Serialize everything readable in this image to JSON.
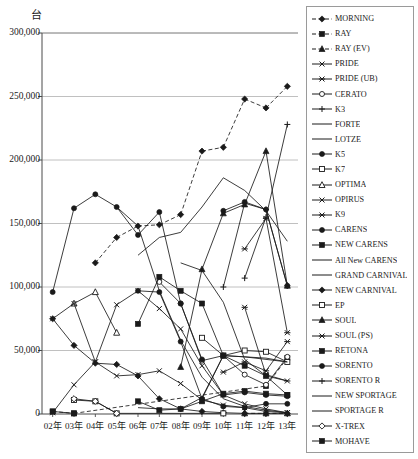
{
  "chart_data": {
    "type": "line",
    "title": "",
    "unit_label": "台",
    "xlabel": "",
    "ylabel": "",
    "ylim": [
      0,
      300000
    ],
    "ytick_values": [
      0,
      50000,
      100000,
      150000,
      200000,
      250000,
      300000
    ],
    "ytick_labels": [
      "0",
      "50,000",
      "100,000",
      "150,000",
      "200,000",
      "250,000",
      "300,000"
    ],
    "grid": true,
    "grid_color": "#b0b0b0",
    "legend_position": "right",
    "categories": [
      "02年",
      "03年",
      "04年",
      "05年",
      "06年",
      "07年",
      "08年",
      "09年",
      "10年",
      "11年",
      "12年",
      "13年"
    ],
    "series": [
      {
        "name": "MORNING",
        "marker": "diamond-filled",
        "line": "dashed",
        "values": [
          null,
          null,
          119000,
          139000,
          148000,
          149000,
          157000,
          207000,
          210000,
          248000,
          241000,
          258000
        ]
      },
      {
        "name": "RAY",
        "marker": "square-filled",
        "line": "dashed",
        "values": [
          2000,
          500,
          null,
          null,
          null,
          null,
          null,
          null,
          null,
          null,
          22000,
          44000
        ]
      },
      {
        "name": "RAY (EV)",
        "marker": "triangle-filled",
        "line": "dashed",
        "values": [
          null,
          null,
          null,
          null,
          null,
          null,
          null,
          null,
          null,
          500,
          500,
          500
        ]
      },
      {
        "name": "PRIDE",
        "marker": "x-thin",
        "line": "solid",
        "values": [
          1000,
          23000,
          41000,
          30000,
          31000,
          34000,
          24000,
          11000,
          7000,
          5000,
          2000,
          1000
        ]
      },
      {
        "name": "PRIDE (UB)",
        "marker": "star",
        "line": "solid",
        "values": [
          null,
          null,
          null,
          null,
          null,
          null,
          null,
          null,
          33000,
          41000,
          34000,
          57000
        ]
      },
      {
        "name": "CERATO",
        "marker": "circle-open",
        "line": "solid",
        "values": [
          null,
          null,
          null,
          null,
          null,
          104000,
          87000,
          42000,
          46000,
          31000,
          23000,
          45000
        ]
      },
      {
        "name": "K3",
        "marker": "plus",
        "line": "solid",
        "values": [
          null,
          null,
          null,
          null,
          null,
          null,
          null,
          null,
          null,
          107000,
          155000,
          228000
        ]
      },
      {
        "name": "FORTE",
        "marker": "none",
        "line": "solid",
        "values": [
          null,
          null,
          null,
          null,
          null,
          null,
          119000,
          113000,
          88000,
          43000,
          30000,
          26000
        ]
      },
      {
        "name": "LOTZE",
        "marker": "none",
        "line": "solid",
        "values": [
          null,
          null,
          null,
          163000,
          148000,
          97000,
          58000,
          29000,
          12000,
          6000,
          3000,
          1000
        ]
      },
      {
        "name": "K5",
        "marker": "circle-filled",
        "line": "solid",
        "values": [
          null,
          null,
          null,
          null,
          null,
          null,
          null,
          null,
          160000,
          167000,
          161000,
          101000
        ]
      },
      {
        "name": "K7",
        "marker": "square-open",
        "line": "solid",
        "values": [
          null,
          null,
          null,
          null,
          null,
          null,
          null,
          60000,
          46000,
          50000,
          49000,
          41000
        ]
      },
      {
        "name": "OPTIMA",
        "marker": "triangle-open",
        "line": "solid",
        "values": [
          null,
          87000,
          96000,
          64000,
          null,
          null,
          null,
          null,
          null,
          null,
          null,
          null
        ]
      },
      {
        "name": "OPIRUS",
        "marker": "x-thin",
        "line": "solid",
        "values": [
          75000,
          87000,
          41000,
          86000,
          97000,
          83000,
          67000,
          38000,
          15000,
          8000,
          4000,
          1000
        ]
      },
      {
        "name": "K9",
        "marker": "star-filled",
        "line": "solid",
        "values": [
          null,
          null,
          null,
          null,
          null,
          null,
          null,
          null,
          null,
          84000,
          31000,
          26000
        ]
      },
      {
        "name": "CARENS",
        "marker": "circle-filled",
        "line": "solid",
        "values": [
          96000,
          162000,
          173000,
          163000,
          141000,
          159000,
          87000,
          43000,
          15000,
          17000,
          15000,
          14000
        ]
      },
      {
        "name": "NEW CARENS",
        "marker": "square-filled",
        "line": "solid",
        "values": [
          null,
          null,
          null,
          null,
          71000,
          108000,
          97000,
          87000,
          46000,
          38000,
          30000,
          15000
        ]
      },
      {
        "name": "All New CARENS",
        "marker": "none",
        "line": "solid",
        "values": [
          null,
          null,
          null,
          null,
          null,
          null,
          null,
          null,
          null,
          null,
          null,
          160000
        ]
      },
      {
        "name": "GRAND CARNIVAL",
        "marker": "none",
        "line": "solid",
        "values": [
          null,
          null,
          null,
          null,
          125000,
          139000,
          143000,
          163000,
          186000,
          176000,
          160000,
          136000
        ]
      },
      {
        "name": "NEW CARNIVAL",
        "marker": "diamond-filled",
        "line": "solid",
        "values": [
          75000,
          54000,
          40000,
          39000,
          30000,
          12000,
          4000,
          2000,
          1000,
          500,
          500,
          500
        ]
      },
      {
        "name": "EP",
        "marker": "square-open",
        "line": "solid",
        "values": [
          null,
          11000,
          10000,
          500,
          null,
          null,
          null,
          null,
          500,
          null,
          null,
          null
        ]
      },
      {
        "name": "SOUL",
        "marker": "triangle-filled",
        "line": "solid",
        "values": [
          null,
          null,
          null,
          null,
          null,
          null,
          37000,
          114000,
          158000,
          165000,
          207000,
          101000
        ]
      },
      {
        "name": "SOUL (PS)",
        "marker": "star",
        "line": "solid",
        "values": [
          null,
          null,
          null,
          null,
          null,
          null,
          null,
          null,
          null,
          130000,
          154000,
          64000
        ]
      },
      {
        "name": "RETONA",
        "marker": "square-filled",
        "line": "solid",
        "values": [
          2000,
          500,
          null,
          null,
          null,
          null,
          null,
          null,
          null,
          null,
          null,
          null
        ]
      },
      {
        "name": "SORENTO",
        "marker": "circle-filled",
        "line": "solid",
        "values": [
          null,
          null,
          null,
          null,
          97000,
          96000,
          57000,
          12000,
          6000,
          5000,
          8000,
          8000
        ]
      },
      {
        "name": "SORENTO R",
        "marker": "plus",
        "line": "solid",
        "values": [
          null,
          null,
          null,
          null,
          null,
          null,
          null,
          null,
          100000,
          166000,
          161000,
          101000
        ]
      },
      {
        "name": "NEW SPORTAGE",
        "marker": "none",
        "line": "solid",
        "values": [
          null,
          null,
          null,
          null,
          5000,
          4000,
          4000,
          13000,
          46000,
          45000,
          44000,
          41000
        ]
      },
      {
        "name": "SPORTAGE R",
        "marker": "none",
        "line": "solid",
        "values": [
          null,
          null,
          null,
          null,
          null,
          null,
          null,
          12000,
          46000,
          45000,
          43000,
          41000
        ]
      },
      {
        "name": "X-TREX",
        "marker": "diamond-open",
        "line": "solid",
        "values": [
          null,
          12000,
          10000,
          500,
          null,
          null,
          null,
          null,
          null,
          null,
          null,
          null
        ]
      },
      {
        "name": "MOHAVE",
        "marker": "square-filled",
        "line": "solid",
        "values": [
          null,
          null,
          null,
          null,
          10000,
          3000,
          4000,
          10000,
          16000,
          18000,
          16000,
          15000
        ]
      }
    ]
  },
  "axis": {
    "unit": "台"
  }
}
